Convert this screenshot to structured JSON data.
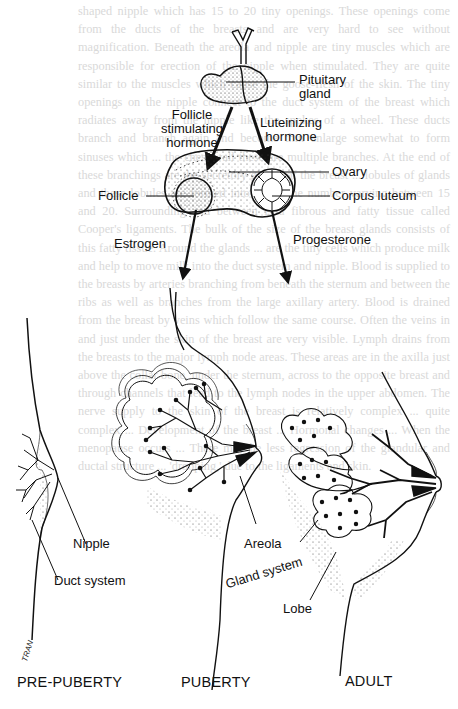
{
  "figure": {
    "hormone_pathway": {
      "pituitary_label": "Pituitary gland",
      "pituitary_line1": "Pituitary",
      "pituitary_line2": "gland",
      "fsh_line1": "Follicle",
      "fsh_line2": "stimulating",
      "fsh_line3": "hormone",
      "lh_line1": "Luteinizing",
      "lh_line2": "hormone",
      "ovary": "Ovary",
      "follicle": "Follicle",
      "corpus_luteum": "Corpus luteum",
      "estrogen": "Estrogen",
      "progesterone": "Progesterone"
    },
    "stages": [
      {
        "label": "PRE-PUBERTY",
        "parts": [
          "Nipple",
          "Duct system"
        ]
      },
      {
        "label": "PUBERTY",
        "parts": [
          "Areola"
        ]
      },
      {
        "label": "ADULT",
        "parts": [
          "Gland system",
          "Lobe"
        ]
      }
    ],
    "labels": {
      "nipple": "Nipple",
      "duct_system": "Duct system",
      "areola": "Areola",
      "gland_system": "Gland system",
      "lobe": "Lobe"
    },
    "signature": "TRAN",
    "colors": {
      "ink": "#111111",
      "paper": "#ffffff",
      "bleed_text": "#d9d9d9"
    }
  },
  "bleed_through_text": "shaped nipple which has 15 to 20 tiny openings. These openings come from the ducts of the breasts and are very hard to see without magnification. Beneath the areola and nipple are tiny muscles which are responsible for erection of the nipple when stimulated. They are quite similar to the muscles which cause the goose-flesh of the skin. The tiny openings on the nipple connect to the duct system of the breast which radiates away from the nipple like the spokes of a wheel. These ducts branch and branch again and become thin enlarge somewhat to form sinuses which ... the chest wall these are multiple branches. At the end of these branchings are the secretory glands of the breast ... lobules of glands and these lobules are formed into lobes, the number varying between 15 and 20. Surrounding and between is a fibrous and fatty tissue called Cooper's ligaments. The bulk of the size of the breast glands consists of this fatty tissue. Around the glands ... are the tiny cells which produce milk and help to move milk into the duct system and nipple. Blood is supplied to the breasts by arteries branching from beneath the sternum and between the ribs as well as branches from the large axillary artery. Blood is drained from the breast by veins which follow the same course. Often the veins in and just under the skin of the breast are very visible. Lymph drains from the breasts to the major lymph node areas. These areas are in the axilla just above the collar bone, under the sternum, across to the opposite breast and through channels that lead to the lymph nodes in the upper abdomen. The nerve supply to the skin of the breast is relatively complex ... quite complex ... Development of the breast ... Hormonal changes ... When the menopause occurs ... There may be less regression of the glandular and ductal structure ... 'drooping,' due to the ligaments and skin."
}
